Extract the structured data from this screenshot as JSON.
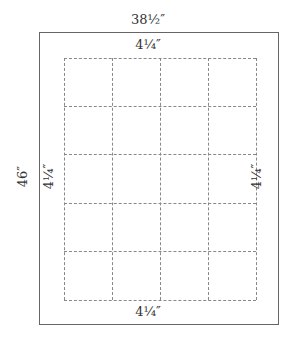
{
  "diagram": {
    "outer_width_label": "38½″",
    "outer_height_label": "46″",
    "margin_top_label": "4¼″",
    "margin_bottom_label": "4¼″",
    "margin_left_label": "4¼″",
    "margin_right_label": "4¼″",
    "grid": {
      "columns": 4,
      "rows": 5
    }
  }
}
